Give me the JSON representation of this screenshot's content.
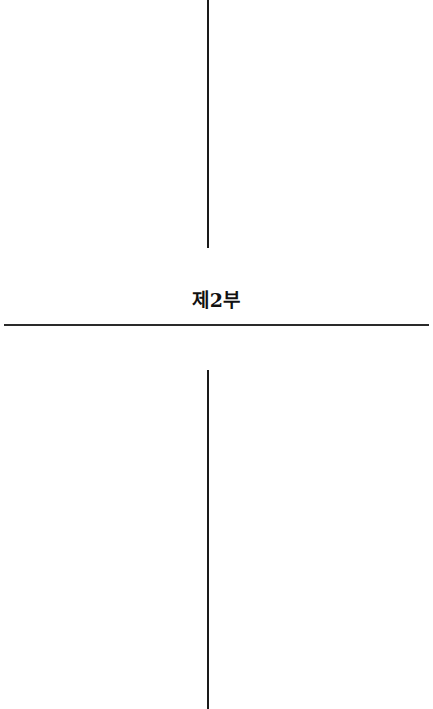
{
  "page": {
    "section_title": "제2부"
  }
}
